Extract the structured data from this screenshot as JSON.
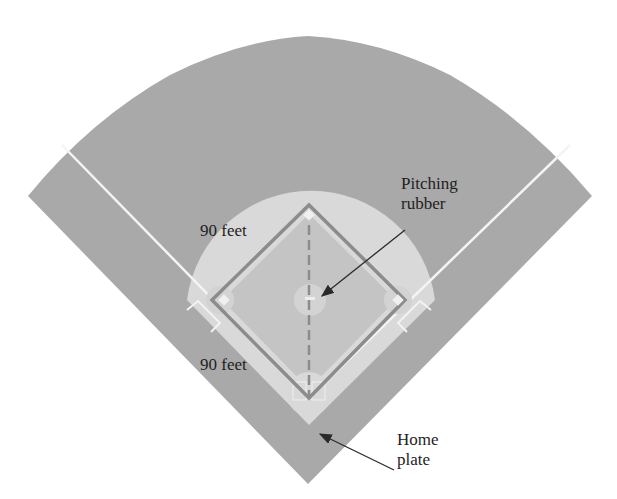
{
  "diagram": {
    "colors": {
      "background": "#ffffff",
      "grass": "#a9a9a9",
      "infield_dirt": "#dcdcdc",
      "infield_grass": "#bdbdbd",
      "baseline": "#8c8c8c",
      "chalk": "#f4f4f4",
      "text": "#1e1e1e",
      "arrow": "#2a2a2a"
    },
    "labels": {
      "side_upper": "90 feet",
      "side_lower": "90 feet",
      "pitching_rubber_line1": "Pitching",
      "pitching_rubber_line2": "rubber",
      "home_plate_line1": "Home",
      "home_plate_line2": "plate"
    },
    "measurements": {
      "base_path_feet": 90
    }
  }
}
